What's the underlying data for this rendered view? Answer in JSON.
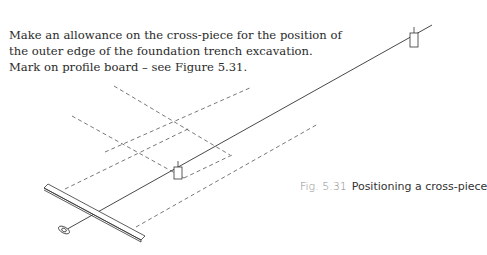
{
  "body_text": {
    "lines": [
      "Make an allowance on the cross-piece for the position of",
      "the outer edge of the foundation trench excavation.",
      "Mark on profile board – see Figure 5.31."
    ]
  },
  "figure": {
    "number": "Fig. 5.31",
    "title": "Positioning a cross-piece",
    "elements": [
      "profile-board",
      "cross-piece",
      "ranging-line",
      "trench-outline-dashed",
      "plumb-bob",
      "peg"
    ]
  }
}
